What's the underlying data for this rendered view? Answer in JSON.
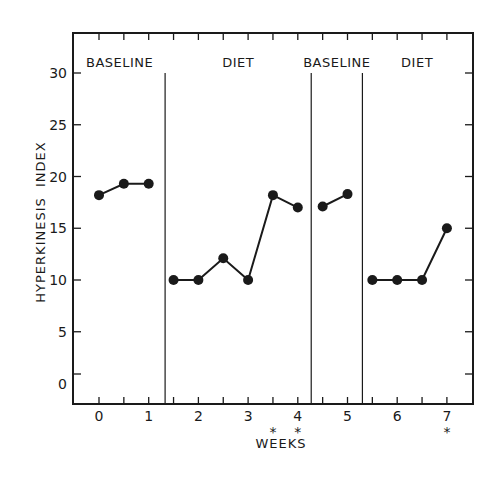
{
  "chart_data": {
    "type": "line",
    "title": "",
    "xlabel": "WEEKS",
    "ylabel": "HYPERKINESIS  INDEX",
    "xlim": [
      -0.5,
      7.5
    ],
    "ylim": [
      -2,
      32
    ],
    "x_ticks": [
      0,
      1,
      2,
      3,
      4,
      5,
      6,
      7
    ],
    "x_tick_labels": [
      "0",
      "1",
      "2",
      "3",
      "4",
      "5",
      "6",
      "7"
    ],
    "x_minor_tick_step": 0.5,
    "y_ticks": [
      0,
      5,
      10,
      15,
      20,
      25,
      30
    ],
    "y_tick_labels": [
      "0",
      "5",
      "10",
      "15",
      "20",
      "25",
      "30"
    ],
    "grid": false,
    "legend": null,
    "phases": [
      {
        "label": "BASELINE",
        "x_start": -0.5,
        "x_end": 1.33
      },
      {
        "label": "DIET",
        "x_start": 1.33,
        "x_end": 4.27
      },
      {
        "label": "BASELINE",
        "x_start": 4.27,
        "x_end": 5.3
      },
      {
        "label": "DIET",
        "x_start": 5.3,
        "x_end": 7.5
      }
    ],
    "phase_dividers": [
      1.33,
      4.27,
      5.3
    ],
    "series": [
      {
        "name": "Baseline 1",
        "x": [
          0,
          0.5,
          1
        ],
        "values": [
          18.2,
          19.3,
          19.3
        ]
      },
      {
        "name": "Diet 1",
        "x": [
          1.5,
          2,
          2.5,
          3,
          3.5,
          4
        ],
        "values": [
          10,
          10,
          12.1,
          10,
          18.2,
          17.0
        ]
      },
      {
        "name": "Baseline 2",
        "x": [
          4.5,
          5
        ],
        "values": [
          17.1,
          18.3
        ]
      },
      {
        "name": "Diet 2",
        "x": [
          5.5,
          6,
          6.5,
          7
        ],
        "values": [
          10,
          10,
          10,
          15
        ]
      }
    ],
    "annotations": [
      {
        "text": "*",
        "x": 3.5,
        "position": "below-axis"
      },
      {
        "text": "*",
        "x": 4,
        "position": "below-axis"
      },
      {
        "text": "*",
        "x": 7,
        "position": "below-axis"
      }
    ]
  },
  "colors": {
    "ink": "#1a1a1a",
    "background": "#ffffff"
  }
}
